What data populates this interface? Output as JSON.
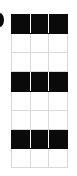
{
  "figure": {
    "kind": "grid-swatch-matrix",
    "background_color": "#ffffff",
    "border_color": "#d8d8d8",
    "fill_color": "#0a0a0a",
    "columns": 3,
    "rows": 8,
    "left_margin_glyph": {
      "name": "clipped-glyph-fragment",
      "text": "",
      "color": "#0b0b0b"
    },
    "column_labels": [
      "",
      "",
      ""
    ],
    "row_labels": [
      "",
      "",
      "",
      "",
      "",
      "",
      "",
      ""
    ],
    "rows_data": [
      {
        "filled": true,
        "cells": [
          "",
          "",
          ""
        ]
      },
      {
        "filled": false,
        "cells": [
          "",
          "",
          ""
        ]
      },
      {
        "filled": false,
        "cells": [
          "",
          "",
          ""
        ]
      },
      {
        "filled": true,
        "cells": [
          "",
          "",
          ""
        ]
      },
      {
        "filled": false,
        "cells": [
          "",
          "",
          ""
        ]
      },
      {
        "filled": false,
        "cells": [
          "",
          "",
          ""
        ]
      },
      {
        "filled": true,
        "cells": [
          "",
          "",
          ""
        ]
      },
      {
        "filled": false,
        "cells": [
          "",
          "",
          ""
        ]
      }
    ]
  }
}
